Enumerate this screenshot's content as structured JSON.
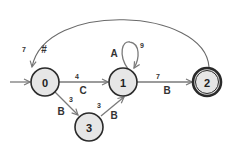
{
  "diagram": {
    "type": "finite-automaton",
    "colors": {
      "node_fill": "#e6e6e6",
      "node_stroke": "#2a2a2a",
      "edge": "#7a7a7a"
    },
    "nodes": [
      {
        "id": "0",
        "label": "0",
        "initial": true,
        "accepting": false
      },
      {
        "id": "1",
        "label": "1",
        "initial": false,
        "accepting": false
      },
      {
        "id": "2",
        "label": "2",
        "initial": false,
        "accepting": true
      },
      {
        "id": "3",
        "label": "3",
        "initial": false,
        "accepting": false
      }
    ],
    "edges": [
      {
        "from": "0",
        "to": "1",
        "symbol": "C",
        "weight": "4"
      },
      {
        "from": "0",
        "to": "3",
        "symbol": "B",
        "weight": "3"
      },
      {
        "from": "3",
        "to": "1",
        "symbol": "B",
        "weight": "3"
      },
      {
        "from": "1",
        "to": "1",
        "symbol": "A",
        "weight": "9"
      },
      {
        "from": "1",
        "to": "2",
        "symbol": "B",
        "weight": "7"
      },
      {
        "from": "2",
        "to": "0",
        "symbol": "#",
        "weight": "7"
      }
    ]
  }
}
